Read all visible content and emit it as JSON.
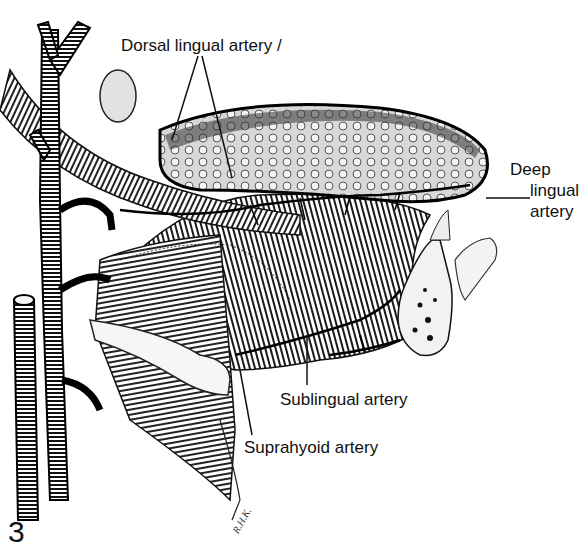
{
  "figure": {
    "number": "3",
    "signature": "R.H.K."
  },
  "labels": {
    "dorsal": "Dorsal lingual artery /",
    "deep_line1": "Deep",
    "deep_line2": "lingual",
    "deep_line3": "artery",
    "sublingual": "Sublingual artery",
    "suprahyoid": "Suprahyoid artery"
  },
  "colors": {
    "ink": "#111111",
    "paper": "#ffffff"
  }
}
